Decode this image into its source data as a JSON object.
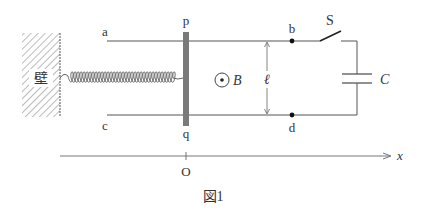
{
  "figure": {
    "caption": "図1",
    "colors": {
      "line": "#555555",
      "rod": "#7a7a7a",
      "text": "#333333",
      "hatch": "#666666"
    }
  },
  "wall": {
    "label": "壁"
  },
  "rails": {
    "top_left_label": "a",
    "bottom_left_label": "c",
    "top_point_label": "b",
    "bottom_point_label": "d"
  },
  "rod": {
    "top_label": "p",
    "bottom_label": "q"
  },
  "field": {
    "label": "B",
    "direction": "out-of-page"
  },
  "separation": {
    "label": "ℓ"
  },
  "switch": {
    "label": "S",
    "state": "open"
  },
  "capacitor": {
    "label": "C"
  },
  "axis": {
    "label": "x",
    "origin_label": "O"
  }
}
